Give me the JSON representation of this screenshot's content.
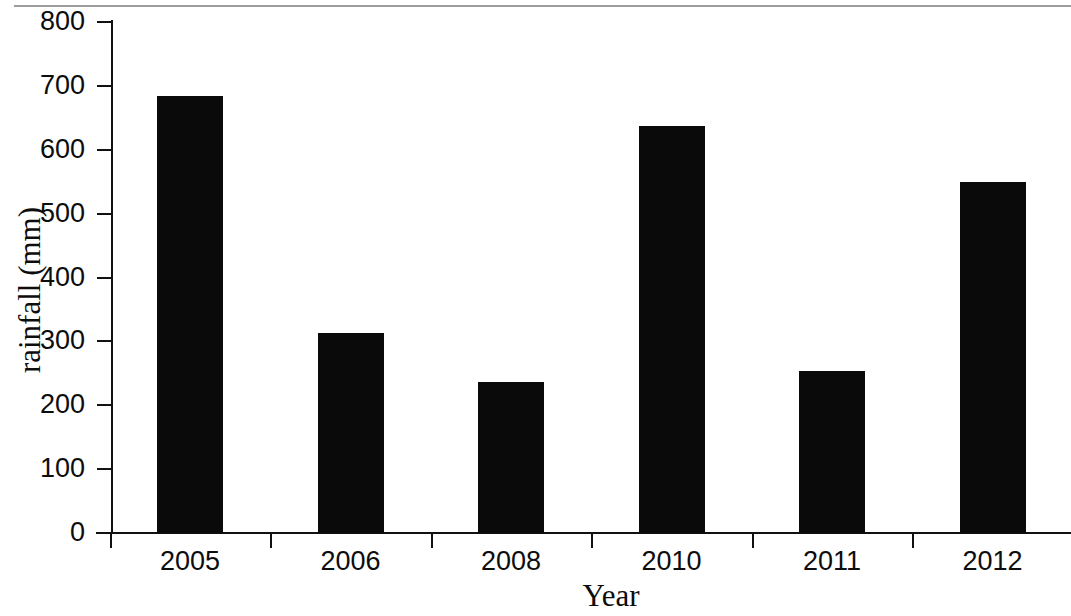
{
  "chart_data": {
    "type": "bar",
    "title": "",
    "subtitle": "",
    "xlabel": "Year",
    "ylabel": "rainfall (mm)",
    "categories": [
      "2005",
      "2006",
      "2008",
      "2010",
      "2011",
      "2012"
    ],
    "values": [
      684,
      313,
      236,
      637,
      254,
      549
    ],
    "series": [
      {
        "name": "rainfall",
        "values": [
          684,
          313,
          236,
          637,
          254,
          549
        ]
      }
    ],
    "ylim": [
      0,
      800
    ],
    "ytick_labels": [
      "800",
      "700",
      "600",
      "500",
      "400",
      "300",
      "200",
      "100",
      "0"
    ],
    "ytick_values": [
      800,
      700,
      600,
      500,
      400,
      300,
      200,
      100,
      0
    ],
    "ytick_step": 100,
    "grid": false,
    "legend": false,
    "legend_position": "none",
    "bar_color": "#0a0a0a",
    "axis_color": "#111111",
    "background_color": "#ffffff"
  }
}
